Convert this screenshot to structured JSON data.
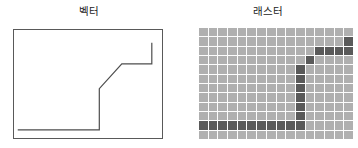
{
  "figure": {
    "caption_present": false,
    "panels": [
      {
        "id": "vector",
        "title": "벡터",
        "type": "vector-illustration"
      },
      {
        "id": "raster",
        "title": "래스터",
        "type": "raster-illustration"
      }
    ]
  },
  "colors": {
    "line": "#4d4d4d",
    "box_border": "#595959",
    "cell_light": "#b0b0b0",
    "cell_dark": "#5a5a5a",
    "grid_line": "#fdfdfd",
    "background": "#ffffff",
    "text": "#1b1b1b"
  },
  "chart_data": {
    "type": "line",
    "xlabel": "",
    "ylabel": "",
    "xlim": [
      0,
      16
    ],
    "ylim": [
      0,
      12
    ],
    "grid": false,
    "legend": "none",
    "series": [
      {
        "name": "벡터",
        "points": [
          [
            0.4,
            1.1
          ],
          [
            9.1,
            1.1
          ],
          [
            9.1,
            5.6
          ],
          [
            11.5,
            8.3
          ],
          [
            14.7,
            8.3
          ],
          [
            14.7,
            10.6
          ]
        ]
      }
    ],
    "raster": {
      "columns": 16,
      "rows": 12,
      "cell_light": "#b0b0b0",
      "cell_dark": "#5a5a5a",
      "dark_cells": [
        [
          11,
          0
        ],
        [
          11,
          1
        ],
        [
          11,
          2
        ],
        [
          11,
          3
        ],
        [
          11,
          4
        ],
        [
          11,
          5
        ],
        [
          11,
          6
        ],
        [
          11,
          7
        ],
        [
          11,
          8
        ],
        [
          11,
          9
        ],
        [
          10,
          9
        ],
        [
          10,
          8
        ],
        [
          10,
          7
        ],
        [
          10,
          6
        ],
        [
          9,
          9
        ],
        [
          9,
          8
        ],
        [
          9,
          7
        ],
        [
          9,
          6
        ],
        [
          8,
          9
        ],
        [
          7,
          9
        ],
        [
          6,
          9
        ],
        [
          5,
          9
        ],
        [
          4,
          9
        ],
        [
          3,
          9
        ]
      ]
    }
  },
  "raster_rows": [
    "................",
    "...............D",
    "............DDDD",
    "...........D....",
    "..........D.....",
    "..........D.....",
    "..........D.....",
    "..........D.....",
    "..........D.....",
    "..........D.....",
    "DDDDDDDDDDD.....",
    "................"
  ]
}
